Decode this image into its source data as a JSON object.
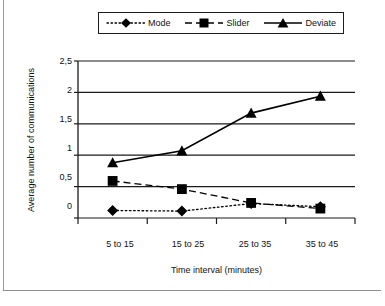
{
  "chart_data": {
    "type": "line",
    "title": "",
    "xlabel": "Time interval (minutes)",
    "ylabel": "Average number of communications",
    "categories": [
      "5 to 15",
      "15 to 25",
      "25 to 35",
      "35 to 45"
    ],
    "ylim": [
      0,
      2.5
    ],
    "yticks": [
      "0",
      "0,5",
      "1",
      "1,5",
      "2",
      "2,5"
    ],
    "ytick_values": [
      0,
      0.5,
      1,
      1.5,
      2,
      2.5
    ],
    "grid": "horizontal",
    "legend_position": "top",
    "series": [
      {
        "name": "Mode",
        "marker": "diamond",
        "line": "dotted",
        "color": "#000000",
        "values": [
          0.12,
          0.11,
          0.23,
          0.18
        ]
      },
      {
        "name": "Slider",
        "marker": "square",
        "line": "dashed",
        "color": "#000000",
        "values": [
          0.59,
          0.46,
          0.24,
          0.15
        ]
      },
      {
        "name": "Deviate",
        "marker": "triangle",
        "line": "solid",
        "color": "#000000",
        "values": [
          0.88,
          1.07,
          1.67,
          1.94
        ]
      }
    ]
  },
  "legend": {
    "entries": [
      {
        "label": "Mode"
      },
      {
        "label": "Slider"
      },
      {
        "label": "Deviate"
      }
    ]
  },
  "axes": {
    "y_title": "Average number of communications",
    "x_title": "Time interval (minutes)",
    "y_labels": [
      "2,5",
      "2",
      "1,5",
      "1",
      "0,5",
      "0"
    ],
    "x_labels": [
      "5 to 15",
      "15 to 25",
      "25 to 35",
      "35 to 45"
    ]
  }
}
